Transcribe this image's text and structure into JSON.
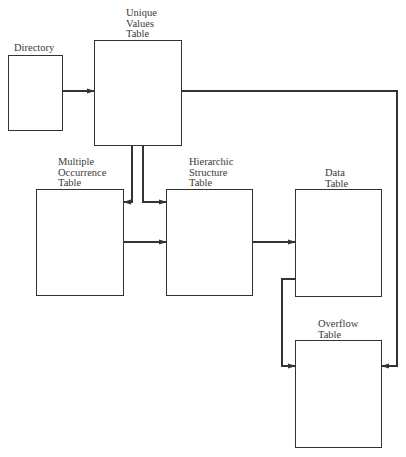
{
  "diagram": {
    "stroke_color": "#333333",
    "boxes": [
      {
        "id": "directory",
        "label": "Directory",
        "x": 8,
        "y": 55,
        "w": 55,
        "h": 76,
        "label_x": 14,
        "label_y": 43
      },
      {
        "id": "unique-values",
        "label": "Unique\nValues\nTable",
        "x": 94,
        "y": 40,
        "w": 88,
        "h": 106,
        "label_x": 126,
        "label_y": 8
      },
      {
        "id": "multiple-occurrence",
        "label": "Multiple\nOccurrence\nTable",
        "x": 36,
        "y": 189,
        "w": 88,
        "h": 107,
        "label_x": 58,
        "label_y": 157
      },
      {
        "id": "hierarchic-structure",
        "label": "Hierarchic\nStructure\nTable",
        "x": 166,
        "y": 189,
        "w": 87,
        "h": 107,
        "label_x": 189,
        "label_y": 157
      },
      {
        "id": "data",
        "label": "Data\nTable",
        "x": 295,
        "y": 189,
        "w": 87,
        "h": 108,
        "label_x": 325,
        "label_y": 168
      },
      {
        "id": "overflow",
        "label": "Overflow\nTable",
        "x": 295,
        "y": 340,
        "w": 87,
        "h": 108,
        "label_x": 318,
        "label_y": 319
      }
    ],
    "connectors": [
      {
        "from": "directory",
        "to": "unique-values",
        "points": [
          [
            63,
            91
          ],
          [
            94,
            91
          ]
        ],
        "arrow": true
      },
      {
        "from": "unique-values",
        "to": "multiple-occurrence",
        "points": [
          [
            132,
            146
          ],
          [
            132,
            202
          ],
          [
            124,
            202
          ]
        ],
        "arrow": true
      },
      {
        "from": "unique-values",
        "to": "hierarchic-structure",
        "points": [
          [
            143,
            146
          ],
          [
            143,
            202
          ],
          [
            166,
            202
          ]
        ],
        "arrow": true
      },
      {
        "from": "multiple-occurrence",
        "to": "hierarchic-structure",
        "points": [
          [
            124,
            242
          ],
          [
            166,
            242
          ]
        ],
        "arrow": true
      },
      {
        "from": "hierarchic-structure",
        "to": "data",
        "points": [
          [
            253,
            242
          ],
          [
            295,
            242
          ]
        ],
        "arrow": true
      },
      {
        "from": "unique-values",
        "to": "overflow",
        "points": [
          [
            182,
            91
          ],
          [
            397,
            91
          ],
          [
            397,
            366
          ],
          [
            382,
            366
          ]
        ],
        "arrow": true
      },
      {
        "from": "data",
        "to": "overflow",
        "points": [
          [
            295,
            279
          ],
          [
            282,
            279
          ],
          [
            282,
            366
          ],
          [
            295,
            366
          ]
        ],
        "arrow": true
      }
    ]
  }
}
